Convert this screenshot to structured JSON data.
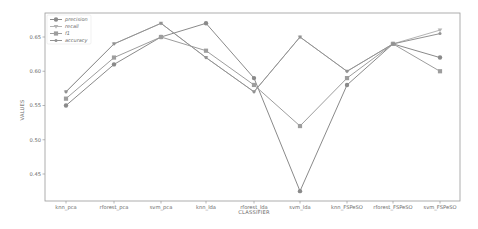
{
  "chart_data": {
    "type": "line",
    "title": "",
    "xlabel": "CLASSIFIER",
    "ylabel": "VALUES",
    "categories": [
      "knn_pca",
      "rforest_pca",
      "svm_pca",
      "knn_lda",
      "rforest_lda",
      "svm_lda",
      "knn_FSPeSO",
      "rforest_FSPeSO",
      "svm_FSPeSO"
    ],
    "yticks": [
      "0.45",
      "0.50",
      "0.55",
      "0.60",
      "0.65"
    ],
    "ylim": [
      0.42,
      0.685
    ],
    "grid": false,
    "legend_position": "upper left",
    "series": [
      {
        "name": "precision",
        "marker": "circle",
        "values": [
          0.55,
          0.61,
          0.65,
          0.67,
          0.59,
          0.425,
          0.58,
          0.64,
          0.62
        ]
      },
      {
        "name": "recall",
        "marker": "triangle",
        "values": [
          0.57,
          0.64,
          0.67,
          0.62,
          0.57,
          0.65,
          0.6,
          0.64,
          0.66
        ]
      },
      {
        "name": "f1",
        "marker": "square",
        "values": [
          0.56,
          0.62,
          0.65,
          0.63,
          0.58,
          0.52,
          0.59,
          0.64,
          0.6
        ]
      },
      {
        "name": "accuracy",
        "marker": "star",
        "values": [
          0.57,
          0.64,
          0.67,
          0.62,
          0.57,
          0.65,
          0.6,
          0.64,
          0.655
        ]
      }
    ]
  },
  "colors": {
    "precision": "#8a8a8a",
    "recall": "#b4b4b4",
    "f1": "#9d9d9d",
    "accuracy": "#929292",
    "axis": "#9a9a9a"
  }
}
